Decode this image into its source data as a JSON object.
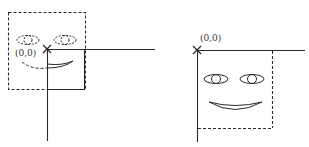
{
  "diagram": {
    "colors": {
      "stroke": "#2a2a2a",
      "background": "#ffffff"
    },
    "left_figure": {
      "origin_label": "(0,0)",
      "origin_marker": "x-cross",
      "description": "dashed face shifted up-left of origin; solid square outline clipped to positive quadrant"
    },
    "right_figure": {
      "origin_label": "(0,0)",
      "origin_marker": "x-cross",
      "description": "solid face within positive quadrant; dashed right and bottom border"
    }
  }
}
